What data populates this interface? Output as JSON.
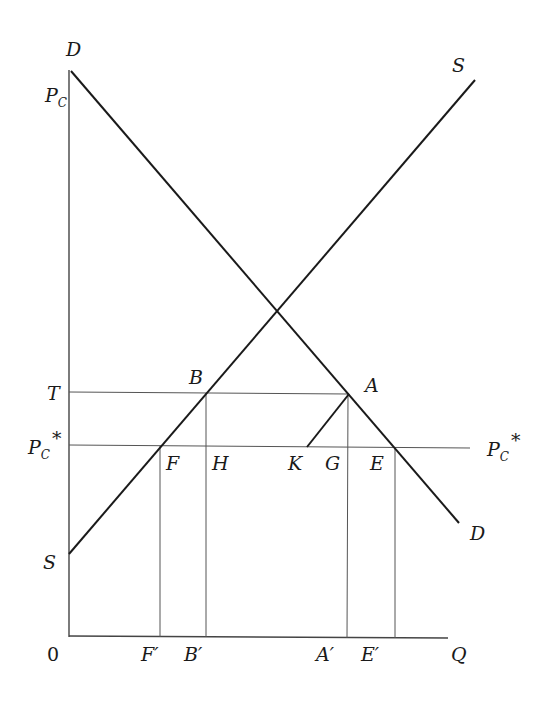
{
  "diagram": {
    "curves": {
      "demand": {
        "label_start": "D",
        "label_end": "D"
      },
      "supply": {
        "label_start": "S",
        "label_end": "S"
      }
    },
    "y_axis_labels": {
      "pc": "P",
      "pc_sub": "C",
      "t": "T",
      "pcstar": "P",
      "pcstar_sub": "C",
      "pcstar_sup": "*",
      "s": "S",
      "origin": "0"
    },
    "right_labels": {
      "pcstar": "P",
      "pcstar_sub": "C",
      "pcstar_sup": "*",
      "d": "D",
      "s": "S"
    },
    "points": {
      "a": "A",
      "b": "B",
      "e": "E",
      "f": "F",
      "g": "G",
      "h": "H",
      "k": "K"
    },
    "x_axis_labels": {
      "f_prime": "F′",
      "b_prime": "B′",
      "a_prime": "A′",
      "e_prime": "E′",
      "q": "Q"
    }
  }
}
